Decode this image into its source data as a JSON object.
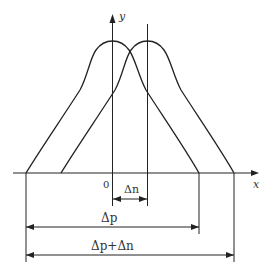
{
  "diagram": {
    "type": "overlapping-bell-curves-with-dimension-lines",
    "axes": {
      "x_label": "x",
      "y_label": "y",
      "origin_label": "0"
    },
    "curves": [
      {
        "name": "curve-1",
        "peak_at": "y-axis"
      },
      {
        "name": "curve-2",
        "peak_at": "shifted right by Δn"
      }
    ],
    "dimensions": {
      "delta_n": "Δn",
      "delta_p": "Δp",
      "delta_p_plus_delta_n": "Δp+Δn"
    },
    "colors": {
      "line": "#222222",
      "text": "#333333",
      "background": "#ffffff"
    }
  }
}
